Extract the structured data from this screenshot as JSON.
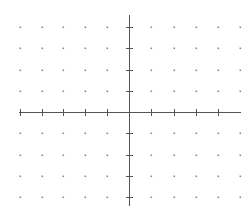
{
  "diagram": {
    "type": "coordinate-grid",
    "axis_color": "#555555",
    "dot_color": "#8a8a8a",
    "tick_color": "#555555",
    "origin": {
      "x": 129,
      "y": 112
    },
    "x_axis": {
      "x1": 19,
      "x2": 241,
      "y": 112
    },
    "y_axis": {
      "x": 129,
      "y1": 15,
      "y2": 206
    },
    "x_ticks": [
      20,
      42,
      63,
      85,
      107,
      151,
      174,
      196,
      218
    ],
    "y_ticks": [
      27,
      48,
      70,
      91,
      133,
      155,
      176,
      197
    ],
    "dot_columns": [
      20,
      42,
      63,
      85,
      107,
      151,
      174,
      196,
      218,
      240
    ],
    "dot_rows": [
      27,
      48,
      70,
      91,
      133,
      155,
      176,
      197
    ],
    "grid_range": {
      "x": [
        -5,
        5
      ],
      "y": [
        -4,
        4
      ]
    }
  }
}
